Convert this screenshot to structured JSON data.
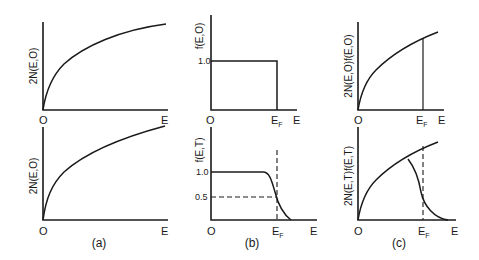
{
  "figure": {
    "panels": [
      {
        "id": "a",
        "caption": "(a)",
        "top": {
          "ylabel": "2N(E,O)",
          "origin": "O",
          "xlabel": "E"
        },
        "bottom": {
          "ylabel": "2N(E,O)",
          "origin": "O",
          "xlabel": "E"
        }
      },
      {
        "id": "b",
        "caption": "(b)",
        "top": {
          "ylabel": "f(E,O)",
          "origin": "O",
          "xlabel": "E",
          "fermi": "E",
          "fermi_sub": "F",
          "tick_1": "1.0"
        },
        "bottom": {
          "ylabel": "f(E,T)",
          "origin": "O",
          "xlabel": "E",
          "fermi": "E",
          "fermi_sub": "F",
          "tick_1": "1.0",
          "tick_05": "0.5"
        }
      },
      {
        "id": "c",
        "caption": "(c)",
        "top": {
          "ylabel": "2N(E,O)f(E,O)",
          "origin": "O",
          "xlabel": "E",
          "fermi": "E",
          "fermi_sub": "F"
        },
        "bottom": {
          "ylabel": "2N(E,T)f(E,T)",
          "origin": "O",
          "xlabel": "E",
          "fermi": "E",
          "fermi_sub": "F"
        }
      }
    ]
  }
}
